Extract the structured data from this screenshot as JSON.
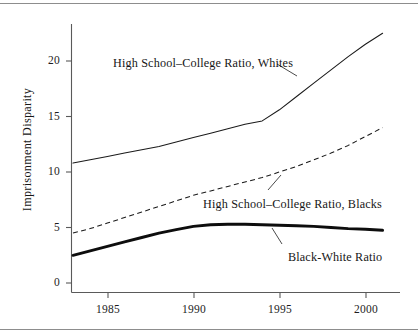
{
  "chart_data": {
    "type": "line",
    "title": "",
    "xlabel": "",
    "ylabel": "Imprisonment Disparity",
    "xlim": [
      1983,
      2001
    ],
    "ylim": [
      0,
      23
    ],
    "grid": false,
    "legend_position": "inline-annotations",
    "x_ticks": [
      1985,
      1990,
      1995,
      2000
    ],
    "y_ticks": [
      0,
      5,
      10,
      15,
      20
    ],
    "x": [
      1983,
      1984,
      1985,
      1986,
      1987,
      1988,
      1989,
      1990,
      1991,
      1992,
      1993,
      1994,
      1995,
      1996,
      1997,
      1998,
      1999,
      2000,
      2001
    ],
    "series": [
      {
        "name": "High School–College Ratio, Whites",
        "style": "solid",
        "values": [
          10.8,
          11.1,
          11.4,
          11.7,
          12.0,
          12.3,
          12.7,
          13.1,
          13.5,
          13.9,
          14.3,
          14.6,
          15.6,
          16.8,
          18.0,
          19.2,
          20.4,
          21.5,
          22.5
        ]
      },
      {
        "name": "High School–College Ratio, Blacks",
        "style": "dashed",
        "values": [
          4.5,
          4.9,
          5.4,
          5.9,
          6.4,
          6.9,
          7.4,
          7.9,
          8.3,
          8.7,
          9.1,
          9.5,
          10.0,
          10.5,
          11.1,
          11.7,
          12.4,
          13.2,
          14.0
        ]
      },
      {
        "name": "Black-White Ratio",
        "style": "bold",
        "values": [
          2.5,
          2.9,
          3.3,
          3.7,
          4.1,
          4.5,
          4.8,
          5.1,
          5.25,
          5.3,
          5.3,
          5.25,
          5.2,
          5.15,
          5.1,
          5.0,
          4.9,
          4.85,
          4.75
        ]
      }
    ],
    "annotations": [
      {
        "id": "whites",
        "text": "High School–College Ratio, Whites"
      },
      {
        "id": "blacks",
        "text": "High School–College Ratio, Blacks"
      },
      {
        "id": "bwratio",
        "text": "Black-White Ratio"
      }
    ],
    "y_tick_labels": [
      "0",
      "5",
      "10",
      "15",
      "20"
    ],
    "x_tick_labels": [
      "1985",
      "1990",
      "1995",
      "2000"
    ],
    "colors": {
      "line": "#1a1a1a",
      "axis": "#5a5a5a",
      "background": "#ffffff",
      "rule": "#8d8d8d"
    }
  },
  "axis": {
    "y_title": "Imprisonment Disparity"
  },
  "y_labels": {
    "t0": "0",
    "t5": "5",
    "t10": "10",
    "t15": "15",
    "t20": "20"
  },
  "x_labels": {
    "t1985": "1985",
    "t1990": "1990",
    "t1995": "1995",
    "t2000": "2000"
  },
  "annotations": {
    "whites": "High School–College Ratio, Whites",
    "blacks": "High School–College Ratio, Blacks",
    "bwratio": "Black-White Ratio"
  }
}
